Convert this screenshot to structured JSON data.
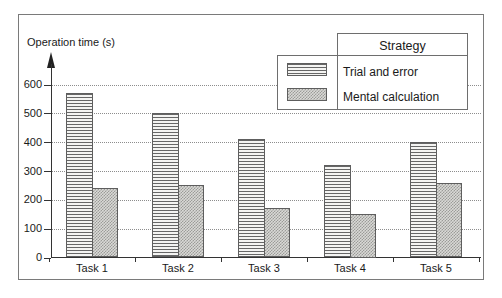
{
  "chart_data": {
    "type": "bar",
    "title": "",
    "xlabel": "",
    "ylabel": "Operation time (s)",
    "ylim": [
      0,
      600
    ],
    "yticks": [
      0,
      100,
      200,
      300,
      400,
      500,
      600
    ],
    "grid": "horizontal-dotted",
    "categories": [
      "Task 1",
      "Task 2",
      "Task 3",
      "Task 4",
      "Task 5"
    ],
    "series": [
      {
        "name": "Trial and error",
        "pattern": "horizontal-stripes",
        "values": [
          570,
          500,
          410,
          320,
          400
        ]
      },
      {
        "name": "Mental calculation",
        "pattern": "gray-checker",
        "values": [
          240,
          250,
          170,
          150,
          260
        ]
      }
    ],
    "legend": {
      "title": "Strategy",
      "position": "top-right"
    }
  },
  "colors": {
    "background": "#ffffff",
    "frame_border": "#7a7a7a",
    "axis": "#333333",
    "gridline": "#8d8d8d",
    "bar_border": "#5e5e5e",
    "stripe_line": "#5f5f5f",
    "checker_dark": "#9b9b98",
    "checker_light": "#d9d9d6",
    "text": "#1a1a1a"
  }
}
